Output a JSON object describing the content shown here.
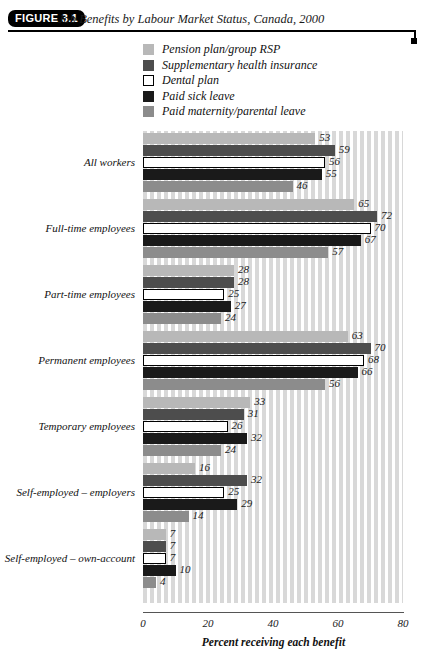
{
  "figure": {
    "badge": "FIGURE 3.1",
    "title": "Job Benefits by Labour Market Status, Canada, 2000"
  },
  "colors": {
    "pension": "#b8b8b8",
    "supplementary": "#4d4d4d",
    "dental": "#ffffff",
    "sick": "#1a1a1a",
    "maternity": "#8c8c8c",
    "axis": "#555555",
    "plot_stripe": "#d8d8d8",
    "plot_gap": "#ffffff",
    "badge_bg": "#000000",
    "badge_fg": "#ffffff"
  },
  "legend": {
    "position": "top-center",
    "items": [
      {
        "label": "Pension plan/group RSP",
        "swatch": "#b8b8b8",
        "border": "none",
        "icon": "legend-swatch-icon"
      },
      {
        "label": "Supplementary health insurance",
        "swatch": "#4d4d4d",
        "border": "none",
        "icon": "legend-swatch-icon"
      },
      {
        "label": "Dental plan",
        "swatch": "#ffffff",
        "border": "#000000",
        "icon": "legend-swatch-icon"
      },
      {
        "label": "Paid sick leave",
        "swatch": "#1a1a1a",
        "border": "none",
        "icon": "legend-swatch-icon"
      },
      {
        "label": "Paid maternity/parental leave",
        "swatch": "#8c8c8c",
        "border": "none",
        "icon": "legend-swatch-icon"
      }
    ]
  },
  "chart_data": {
    "type": "bar",
    "orientation": "horizontal",
    "title": "Job Benefits by Labour Market Status, Canada, 2000",
    "subtitle": "",
    "xlabel": "Percent receiving each benefit",
    "ylabel": "",
    "xlim": [
      0,
      80
    ],
    "xticks": [
      0,
      20,
      40,
      60,
      80
    ],
    "xticklabels": [
      "0",
      "20",
      "40",
      "60",
      "80"
    ],
    "grid": false,
    "background": "vertical-stripes",
    "legend_position": "top-center",
    "value_labels": true,
    "categories": [
      "All workers",
      "Full-time employees",
      "Part-time employees",
      "Permanent employees",
      "Temporary employees",
      "Self-employed – employers",
      "Self-employed – own-account"
    ],
    "series": [
      {
        "name": "Pension plan/group RSP",
        "color": "#b8b8b8",
        "values": [
          53,
          65,
          28,
          63,
          33,
          16,
          7
        ]
      },
      {
        "name": "Supplementary health insurance",
        "color": "#4d4d4d",
        "values": [
          59,
          72,
          28,
          70,
          31,
          32,
          7
        ]
      },
      {
        "name": "Dental plan",
        "color": "#ffffff",
        "values": [
          56,
          70,
          25,
          68,
          26,
          25,
          7
        ]
      },
      {
        "name": "Paid sick leave",
        "color": "#1a1a1a",
        "values": [
          55,
          67,
          27,
          66,
          32,
          29,
          10
        ]
      },
      {
        "name": "Paid maternity/parental leave",
        "color": "#8c8c8c",
        "values": [
          46,
          57,
          24,
          56,
          24,
          14,
          4
        ]
      }
    ]
  }
}
